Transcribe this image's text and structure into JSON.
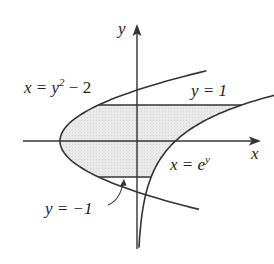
{
  "diagram": {
    "type": "region-between-curves",
    "axes": {
      "x_label": "x",
      "y_label": "y"
    },
    "curves": [
      {
        "id": "parabola",
        "equation": "x = y^2 - 2",
        "label_parts": [
          "x = y",
          "2",
          " − 2"
        ]
      },
      {
        "id": "exponential",
        "equation": "x = e^y",
        "label_parts": [
          "x = e",
          "y"
        ]
      }
    ],
    "bounds": [
      {
        "id": "upper",
        "equation": "y = 1",
        "label": "y = 1"
      },
      {
        "id": "lower",
        "equation": "y = -1",
        "label": "y = −1"
      }
    ],
    "shaded_region": {
      "y_range": [
        -1,
        1
      ],
      "left": "x = y^2 - 2",
      "right": "x = e^y"
    },
    "colors": {
      "stroke": "#333333",
      "fill": "#e6e6e6",
      "background": "#ffffff"
    }
  }
}
